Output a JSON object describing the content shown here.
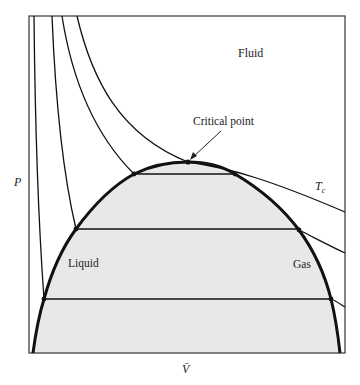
{
  "diagram": {
    "type": "pressure-volume phase diagram",
    "axes": {
      "y_label": "P",
      "x_label": "V̄"
    },
    "regions": {
      "fluid": "Fluid",
      "liquid": "Liquid",
      "gas": "Gas"
    },
    "annotations": {
      "critical_point": "Critical point",
      "critical_isotherm": "T",
      "critical_isotherm_subscript": "c"
    },
    "colors": {
      "coexistence_fill": "#e8e8e8",
      "line": "#111111",
      "frame": "#444444",
      "background": "#ffffff"
    }
  }
}
